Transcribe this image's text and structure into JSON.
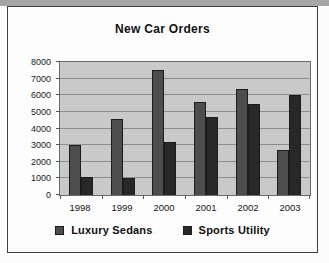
{
  "chart_data": {
    "type": "bar",
    "title": "New Car Orders",
    "categories": [
      "1998",
      "1999",
      "2000",
      "2001",
      "2002",
      "2003"
    ],
    "series": [
      {
        "name": "Luxury Sedans",
        "color": "#4d4d4d",
        "values": [
          3000,
          4600,
          7500,
          5600,
          6400,
          2700
        ]
      },
      {
        "name": "Sports Utility",
        "color": "#282828",
        "values": [
          1100,
          1000,
          3200,
          4700,
          5500,
          6000
        ]
      }
    ],
    "ylim": [
      0,
      8000
    ],
    "ytick_labels": [
      "0",
      "1000",
      "2000",
      "3000",
      "4000",
      "5000",
      "6000",
      "7000",
      "8000"
    ],
    "grid": "horizontal",
    "legend_position": "bottom",
    "plot_bg": "#c9c9c9",
    "gridline_color": "#8c8c8c"
  }
}
